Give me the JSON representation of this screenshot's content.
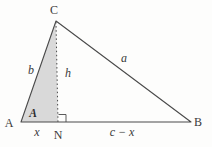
{
  "diagram": {
    "type": "geometry-triangle-with-altitude",
    "vertex_labels": {
      "A": "A",
      "B": "B",
      "C": "C",
      "N": "N"
    },
    "side_labels": {
      "left_side": "b",
      "right_side": "a",
      "altitude": "h",
      "base_left_segment": "x",
      "base_right_segment": "c − x"
    },
    "angle_labels": {
      "at_A": "A"
    },
    "colors": {
      "line": "#4a4a4a",
      "shade_fill": "#d9d9d9",
      "text": "#3a3a3a",
      "background": "#fdfdfc"
    }
  }
}
